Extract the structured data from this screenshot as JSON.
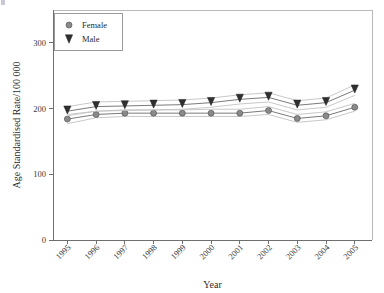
{
  "chart_data": {
    "type": "line",
    "title": "",
    "xlabel": "Year",
    "ylabel": "Age Standardised Rate/100 000",
    "x": [
      1995,
      1996,
      1997,
      1998,
      1999,
      2000,
      2001,
      2002,
      2003,
      2004,
      2005
    ],
    "xticklabels": [
      "1995",
      "1996",
      "1997",
      "1998",
      "1999",
      "2000",
      "2001",
      "2002",
      "2003",
      "2004",
      "2005"
    ],
    "yticklabels": [
      "0",
      "100",
      "200",
      "300"
    ],
    "yticks": [
      0,
      100,
      200,
      300
    ],
    "ylim": [
      0,
      350
    ],
    "xlim": [
      1994.5,
      2005.6
    ],
    "grid": false,
    "legend_position": "top-left",
    "series": [
      {
        "name": "Female",
        "marker": "circle",
        "color": "#8a8a8a",
        "values": [
          184,
          191,
          193,
          193,
          193,
          193,
          193,
          197,
          185,
          189,
          202
        ],
        "ci_upper": [
          191,
          196,
          198,
          198,
          198,
          199,
          199,
          203,
          191,
          195,
          208
        ],
        "ci_lower": [
          177,
          186,
          188,
          188,
          188,
          188,
          188,
          191,
          179,
          183,
          196
        ]
      },
      {
        "name": "Male",
        "marker": "triangle-down",
        "color": "#2f2f2f",
        "values": [
          196,
          203,
          204,
          205,
          206,
          209,
          214,
          217,
          205,
          209,
          228
        ],
        "ci_upper": [
          203,
          210,
          211,
          212,
          213,
          216,
          221,
          224,
          212,
          216,
          236
        ],
        "ci_lower": [
          189,
          196,
          197,
          198,
          199,
          202,
          207,
          210,
          198,
          202,
          220
        ]
      }
    ]
  },
  "legend": {
    "entries": [
      {
        "label": "Female",
        "marker": "circle"
      },
      {
        "label": "Male",
        "marker": "triangle-down"
      }
    ]
  },
  "axes": {
    "x_title": "Year",
    "y_title": "Age Standardised Rate/100 000"
  }
}
